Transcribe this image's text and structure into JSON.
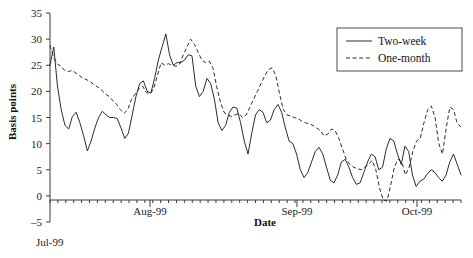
{
  "chart_data": {
    "type": "line",
    "title": "",
    "xlabel": "Date",
    "ylabel": "Basis points",
    "ylim": [
      -5,
      35
    ],
    "yticks": [
      -5,
      0,
      5,
      10,
      15,
      20,
      25,
      30,
      35
    ],
    "ytick_labels": [
      "–5",
      "0",
      "5",
      "10",
      "15",
      "20",
      "25",
      "30",
      "35"
    ],
    "xlim": [
      0,
      102
    ],
    "xtick_labels": [
      "Jul-99",
      "Aug-99",
      "Sep-99",
      "Oct-99"
    ],
    "xtick_positions": [
      0,
      23,
      46,
      69
    ],
    "grid": false,
    "legend_position": "top-right",
    "legend_entries": [
      {
        "name": "Two-week",
        "style": "solid"
      },
      {
        "name": "One-month",
        "style": "dashed"
      }
    ],
    "series": [
      {
        "name": "Two-week",
        "style": "solid",
        "values": [
          25.0,
          28.5,
          21.0,
          16.5,
          13.5,
          12.8,
          15.2,
          16.0,
          14.0,
          11.5,
          8.6,
          10.5,
          13.0,
          15.0,
          16.2,
          15.5,
          15.0,
          15.0,
          14.8,
          13.0,
          11.0,
          12.0,
          15.5,
          19.0,
          21.5,
          22.0,
          20.0,
          19.7,
          22.5,
          26.0,
          28.5,
          31.0,
          27.0,
          25.0,
          25.5,
          25.5,
          26.0,
          27.0,
          26.8,
          21.0,
          19.0,
          20.0,
          22.5,
          21.5,
          18.5,
          14.0,
          12.5,
          13.5,
          16.0,
          17.0,
          16.8,
          14.0,
          10.5,
          8.0,
          12.0,
          15.5,
          16.5,
          16.0,
          14.0,
          14.5,
          16.5,
          17.5,
          16.0,
          13.0,
          10.5,
          10.0,
          8.0,
          5.0,
          3.5,
          4.5,
          6.5,
          8.5,
          9.3,
          8.0,
          5.5,
          3.0,
          2.5,
          4.0,
          6.5,
          7.0,
          5.5,
          3.5,
          2.2,
          2.5,
          4.5,
          6.5,
          8.0,
          7.5,
          5.0,
          5.5,
          9.0,
          11.0,
          10.5,
          8.0,
          6.0,
          9.5,
          8.5,
          4.0,
          1.8,
          2.8,
          3.2,
          4.2,
          5.0,
          4.5,
          3.5,
          2.8,
          4.0,
          6.5,
          8.0,
          6.0,
          4.0
        ]
      },
      {
        "name": "One-month",
        "style": "dashed",
        "values": [
          28.8,
          26.5,
          25.2,
          24.8,
          24.0,
          23.8,
          24.0,
          23.5,
          23.0,
          22.5,
          22.2,
          21.8,
          21.2,
          20.8,
          20.2,
          19.5,
          19.0,
          18.2,
          17.5,
          16.5,
          15.8,
          16.5,
          18.5,
          19.5,
          20.5,
          21.0,
          19.8,
          19.5,
          20.5,
          23.0,
          25.5,
          25.0,
          25.3,
          25.0,
          24.8,
          25.2,
          27.0,
          28.5,
          30.0,
          29.0,
          27.5,
          26.0,
          25.5,
          25.8,
          24.5,
          21.0,
          18.0,
          16.0,
          15.5,
          15.2,
          15.5,
          15.8,
          15.0,
          15.5,
          17.0,
          18.5,
          20.0,
          21.5,
          23.0,
          24.2,
          24.5,
          23.0,
          19.5,
          16.5,
          15.5,
          15.3,
          15.0,
          14.8,
          14.3,
          14.0,
          13.8,
          13.5,
          13.0,
          12.5,
          11.5,
          11.8,
          12.8,
          12.5,
          11.0,
          9.0,
          7.0,
          6.0,
          5.5,
          5.2,
          5.0,
          5.5,
          6.0,
          6.8,
          5.0,
          1.5,
          -0.8,
          -1.0,
          2.0,
          5.5,
          7.0,
          6.5,
          4.0,
          5.5,
          8.5,
          10.5,
          11.0,
          14.0,
          16.5,
          17.2,
          15.0,
          10.0,
          8.0,
          13.0,
          17.0,
          16.5,
          13.8,
          13.2
        ]
      }
    ]
  }
}
